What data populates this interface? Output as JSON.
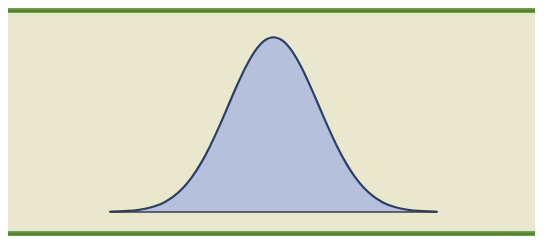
{
  "figure": {
    "caption_remnant": "•••••••••••••••••••••••••••••••••••••••••",
    "panel_background": "#e9e7cd",
    "page_background": "#ffffff",
    "rule_color": "#5d8a38"
  },
  "chart_data": {
    "type": "area",
    "title": "",
    "subtitle": "",
    "xlabel": "",
    "ylabel": "",
    "grid": false,
    "legend": null,
    "annotations": [],
    "xticks": [],
    "yticks": [],
    "xticklabels": [],
    "yticklabels": [],
    "xlim": [
      -3.6,
      3.6
    ],
    "ylim": [
      0,
      0.42
    ],
    "baseline_y": 0,
    "style": {
      "fill_color": "#b6c0dc",
      "line_color": "#2a3f6b",
      "line_width": 2.2,
      "baseline_color": "#3d3f33",
      "baseline_width": 1.4
    },
    "series": [
      {
        "name": "normal-distribution",
        "distribution": "gaussian",
        "mean": 0,
        "std_dev": 1,
        "peak_value": 0.3989,
        "x": [
          -3.6,
          -3.4,
          -3.2,
          -3.0,
          -2.8,
          -2.6,
          -2.4,
          -2.2,
          -2.0,
          -1.8,
          -1.6,
          -1.4,
          -1.2,
          -1.0,
          -0.8,
          -0.6,
          -0.4,
          -0.2,
          0.0,
          0.2,
          0.4,
          0.6,
          0.8,
          1.0,
          1.2,
          1.4,
          1.6,
          1.8,
          2.0,
          2.2,
          2.4,
          2.6,
          2.8,
          3.0,
          3.2,
          3.4,
          3.6
        ],
        "values": [
          0.0006,
          0.0012,
          0.0024,
          0.0044,
          0.0079,
          0.0136,
          0.0224,
          0.0355,
          0.054,
          0.079,
          0.1109,
          0.1497,
          0.1942,
          0.242,
          0.2897,
          0.3332,
          0.3683,
          0.391,
          0.3989,
          0.391,
          0.3683,
          0.3332,
          0.2897,
          0.242,
          0.1942,
          0.1497,
          0.1109,
          0.079,
          0.054,
          0.0355,
          0.0224,
          0.0136,
          0.0079,
          0.0044,
          0.0024,
          0.0012,
          0.0006
        ]
      }
    ]
  }
}
